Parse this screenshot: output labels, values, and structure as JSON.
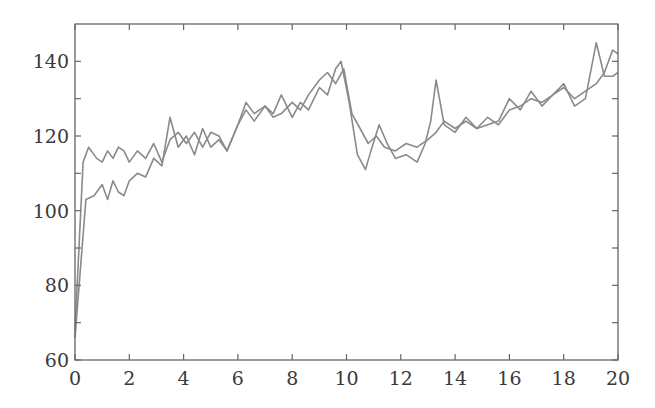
{
  "chart_data": {
    "type": "line",
    "title": "",
    "xlabel": "",
    "ylabel": "",
    "xlim": [
      0,
      20
    ],
    "ylim": [
      60,
      150
    ],
    "xticks": [
      0,
      2,
      4,
      6,
      8,
      10,
      12,
      14,
      16,
      18,
      20
    ],
    "yticks": [
      60,
      80,
      100,
      120,
      140
    ],
    "y_minor_ticks": [
      70,
      90,
      110,
      130
    ],
    "x_minor_ticks": [
      1,
      3,
      5,
      7,
      9,
      11,
      13,
      15,
      17,
      19
    ],
    "grid": false,
    "legend": null,
    "line_color": "#8a8a8a",
    "series": [
      {
        "name": "series-1",
        "x": [
          0,
          0.3,
          0.5,
          0.8,
          1.0,
          1.2,
          1.4,
          1.6,
          1.8,
          2.0,
          2.3,
          2.6,
          2.9,
          3.2,
          3.5,
          3.8,
          4.1,
          4.4,
          4.7,
          5.0,
          5.3,
          5.6,
          6.0,
          6.3,
          6.6,
          7.0,
          7.3,
          7.6,
          8.0,
          8.3,
          8.6,
          9.0,
          9.3,
          9.6,
          9.9,
          10.2,
          10.5,
          10.8,
          11.1,
          11.4,
          11.8,
          12.2,
          12.6,
          13.0,
          13.3,
          13.6,
          14.0,
          14.4,
          14.8,
          15.2,
          15.6,
          16.0,
          16.4,
          16.8,
          17.2,
          17.6,
          18.0,
          18.4,
          18.8,
          19.2,
          19.5,
          19.8,
          20.0
        ],
        "y": [
          68,
          113,
          117,
          114,
          113,
          116,
          114,
          117,
          116,
          113,
          116,
          114,
          118,
          113,
          119,
          121,
          118,
          121,
          117,
          121,
          120,
          116,
          123,
          127,
          124,
          128,
          125,
          126,
          129,
          127,
          131,
          135,
          137,
          134,
          138,
          126,
          122,
          118,
          120,
          117,
          116,
          118,
          117,
          119,
          121,
          124,
          122,
          124,
          122,
          125,
          123,
          127,
          128,
          130,
          129,
          131,
          133,
          130,
          132,
          134,
          137,
          143,
          142
        ]
      },
      {
        "name": "series-2",
        "x": [
          0,
          0.4,
          0.7,
          1.0,
          1.2,
          1.4,
          1.6,
          1.8,
          2.0,
          2.3,
          2.6,
          2.9,
          3.2,
          3.5,
          3.8,
          4.1,
          4.4,
          4.7,
          5.0,
          5.3,
          5.6,
          6.0,
          6.3,
          6.6,
          7.0,
          7.3,
          7.6,
          8.0,
          8.3,
          8.6,
          9.0,
          9.3,
          9.6,
          9.8,
          10.1,
          10.4,
          10.7,
          10.9,
          11.2,
          11.5,
          11.8,
          12.2,
          12.6,
          12.9,
          13.1,
          13.3,
          13.6,
          14.0,
          14.4,
          14.8,
          15.2,
          15.6,
          16.0,
          16.4,
          16.8,
          17.2,
          17.6,
          18.0,
          18.4,
          18.8,
          19.2,
          19.5,
          19.8,
          20.0
        ],
        "y": [
          66,
          103,
          104,
          107,
          103,
          108,
          105,
          104,
          108,
          110,
          109,
          114,
          112,
          125,
          117,
          120,
          115,
          122,
          117,
          119,
          116,
          123,
          129,
          126,
          128,
          126,
          131,
          125,
          129,
          127,
          133,
          131,
          138,
          140,
          129,
          115,
          111,
          116,
          123,
          118,
          114,
          115,
          113,
          118,
          124,
          135,
          123,
          121,
          125,
          122,
          123,
          124,
          130,
          127,
          132,
          128,
          131,
          134,
          128,
          130,
          145,
          136,
          136,
          137
        ]
      }
    ]
  }
}
